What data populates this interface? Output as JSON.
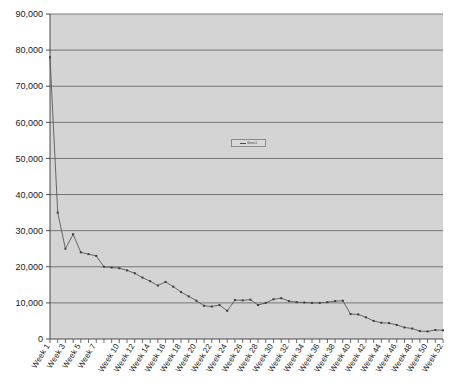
{
  "chart_data": {
    "type": "line",
    "title": "",
    "xlabel": "",
    "ylabel": "",
    "ylim": [
      0,
      90000
    ],
    "grid": true,
    "legend_position": "center",
    "plot_background": "#d4d4d4",
    "line_color": "#595959",
    "marker_color": "#3d3d3d",
    "gridline_color": "#6b6b6b",
    "axis_color": "#4a4a4a",
    "y_ticks": [
      0,
      10000,
      20000,
      30000,
      40000,
      50000,
      60000,
      70000,
      80000,
      90000
    ],
    "y_tick_labels": [
      "0",
      "10,000",
      "20,000",
      "30,000",
      "40,000",
      "50,000",
      "60,000",
      "70,000",
      "80,000",
      "90,000"
    ],
    "x_tick_labels": [
      "Week 1",
      "Week 3",
      "Week 5",
      "Week 7",
      "Week 10",
      "Week 12",
      "Week 14",
      "Week 16",
      "Week 18",
      "Week 20",
      "Week 22",
      "Week 24",
      "Week 26",
      "Week 28",
      "Week 30",
      "Week 32",
      "Week 34",
      "Week 36",
      "Week 38",
      "Week 40",
      "Week 42",
      "Week 44",
      "Week 46",
      "Week 48",
      "Week 50",
      "Week 52"
    ],
    "categories": [
      "Week 1",
      "Week 2",
      "Week 3",
      "Week 4",
      "Week 5",
      "Week 6",
      "Week 7",
      "Week 8",
      "Week 9",
      "Week 10",
      "Week 11",
      "Week 12",
      "Week 13",
      "Week 14",
      "Week 15",
      "Week 16",
      "Week 17",
      "Week 18",
      "Week 19",
      "Week 20",
      "Week 21",
      "Week 22",
      "Week 23",
      "Week 24",
      "Week 25",
      "Week 26",
      "Week 27",
      "Week 28",
      "Week 29",
      "Week 30",
      "Week 31",
      "Week 32",
      "Week 33",
      "Week 34",
      "Week 35",
      "Week 36",
      "Week 37",
      "Week 38",
      "Week 39",
      "Week 40",
      "Week 41",
      "Week 42",
      "Week 43",
      "Week 44",
      "Week 45",
      "Week 46",
      "Week 47",
      "Week 48",
      "Week 49",
      "Week 50",
      "Week 51",
      "Week 52"
    ],
    "series": [
      {
        "name": "Series1",
        "values": [
          78000,
          35000,
          25000,
          29000,
          24000,
          23500,
          23000,
          20000,
          19800,
          19600,
          19000,
          18200,
          17000,
          16000,
          14800,
          15800,
          14500,
          13000,
          11800,
          10600,
          9200,
          9000,
          9400,
          7800,
          10800,
          10700,
          10900,
          9400,
          10000,
          11000,
          11300,
          10500,
          10200,
          10100,
          10000,
          10000,
          10200,
          10500,
          10600,
          6900,
          6800,
          6000,
          5000,
          4500,
          4400,
          3900,
          3200,
          2900,
          2200,
          2100,
          2500,
          2400
        ]
      }
    ]
  },
  "legend": {
    "label": "Series1"
  }
}
